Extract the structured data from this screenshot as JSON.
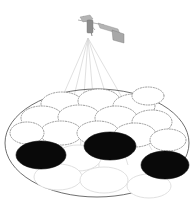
{
  "figure": {
    "title": "Satellite multi-beam cellular coverage footprint",
    "caption": "A satellite illuminating a circular service area tiled with hexagonally packed spot-beam cells; three cells are shown active (filled black).",
    "background_color": "#ffffff",
    "width": 196,
    "height": 210
  },
  "satellite": {
    "name": "satellite",
    "label": "Satellite",
    "body_color": "#8d8d8d",
    "panel_color": "#b4b4b4",
    "dish_color": "#a8a8a8",
    "position": {
      "x": 97,
      "y": 28
    },
    "beam_origin": {
      "x": 88,
      "y": 38
    }
  },
  "beams": {
    "name": "beam-bundle",
    "count": 6,
    "color": "#d2d2d2",
    "origin": {
      "x": 88,
      "y": 38
    },
    "targets": [
      {
        "x": 35,
        "y": 160
      },
      {
        "x": 55,
        "y": 175
      },
      {
        "x": 78,
        "y": 182
      },
      {
        "x": 100,
        "y": 178
      },
      {
        "x": 128,
        "y": 165
      },
      {
        "x": 152,
        "y": 150
      }
    ]
  },
  "coverage_area": {
    "name": "coverage-ellipse",
    "label": "Coverage footprint",
    "center": {
      "x": 97,
      "y": 143
    },
    "rx": 92,
    "ry": 54,
    "stroke_color": "#4a4a4a"
  },
  "chart_data": {
    "type": "scatter",
    "title": "Satellite multi-beam cellular coverage footprint",
    "xlabel": "",
    "ylabel": "",
    "legend": [
      {
        "label": "Inactive cell (dotted outline)",
        "color": "#ffffff",
        "stroke": "#8e8e8e"
      },
      {
        "label": "Inactive cell (solid outline)",
        "color": "#ffffff",
        "stroke": "#dcdcdc"
      },
      {
        "label": "Active beam cell",
        "color": "#090909",
        "stroke": "#090909"
      }
    ],
    "cells": [
      {
        "id": "c1",
        "cx": 62,
        "cy": 104,
        "rx": 21,
        "ry": 12,
        "style": "dotted",
        "state": "inactive"
      },
      {
        "id": "c2",
        "cx": 99,
        "cy": 101,
        "rx": 21,
        "ry": 12,
        "style": "dotted",
        "state": "inactive"
      },
      {
        "id": "c3",
        "cx": 134,
        "cy": 106,
        "rx": 21,
        "ry": 12,
        "style": "dotted",
        "state": "inactive"
      },
      {
        "id": "c4",
        "cx": 42,
        "cy": 118,
        "rx": 21,
        "ry": 12,
        "style": "dotted",
        "state": "inactive"
      },
      {
        "id": "c5",
        "cx": 79,
        "cy": 117,
        "rx": 21,
        "ry": 12,
        "style": "dotted",
        "state": "inactive"
      },
      {
        "id": "c6",
        "cx": 116,
        "cy": 118,
        "rx": 21,
        "ry": 12,
        "style": "dotted",
        "state": "inactive"
      },
      {
        "id": "c7",
        "cx": 152,
        "cy": 122,
        "rx": 20,
        "ry": 12,
        "style": "dotted",
        "state": "inactive"
      },
      {
        "id": "c8",
        "cx": 61,
        "cy": 133,
        "rx": 21,
        "ry": 12,
        "style": "dotted",
        "state": "inactive"
      },
      {
        "id": "c9",
        "cx": 98,
        "cy": 133,
        "rx": 21,
        "ry": 12,
        "style": "dotted",
        "state": "inactive"
      },
      {
        "id": "c10",
        "cx": 135,
        "cy": 135,
        "rx": 21,
        "ry": 12,
        "style": "dotted",
        "state": "inactive"
      },
      {
        "id": "c11",
        "cx": 41,
        "cy": 155,
        "rx": 25,
        "ry": 14,
        "style": "active",
        "state": "active"
      },
      {
        "id": "c12",
        "cx": 110,
        "cy": 146,
        "rx": 26,
        "ry": 14,
        "style": "active",
        "state": "active"
      },
      {
        "id": "c13",
        "cx": 165,
        "cy": 165,
        "rx": 24,
        "ry": 14,
        "style": "active",
        "state": "active"
      },
      {
        "id": "c14",
        "cx": 78,
        "cy": 158,
        "rx": 23,
        "ry": 13,
        "style": "solid",
        "state": "inactive"
      },
      {
        "id": "c15",
        "cx": 58,
        "cy": 177,
        "rx": 24,
        "ry": 13,
        "style": "solid",
        "state": "inactive"
      },
      {
        "id": "c16",
        "cx": 104,
        "cy": 180,
        "rx": 24,
        "ry": 13,
        "style": "solid",
        "state": "inactive"
      },
      {
        "id": "c17",
        "cx": 149,
        "cy": 186,
        "rx": 22,
        "ry": 12,
        "style": "solid",
        "state": "inactive"
      },
      {
        "id": "c18",
        "cx": 27,
        "cy": 133,
        "rx": 17,
        "ry": 11,
        "style": "dotted",
        "state": "inactive"
      },
      {
        "id": "c19",
        "cx": 168,
        "cy": 140,
        "rx": 18,
        "ry": 11,
        "style": "dotted",
        "state": "inactive"
      },
      {
        "id": "c20",
        "cx": 148,
        "cy": 96,
        "rx": 16,
        "ry": 9,
        "style": "dotted",
        "state": "inactive"
      }
    ],
    "active_cell_ids": [
      "c11",
      "c12",
      "c13"
    ],
    "active_cell_count": 3,
    "total_cell_count": 20,
    "grid": false,
    "legend_position": "none"
  }
}
